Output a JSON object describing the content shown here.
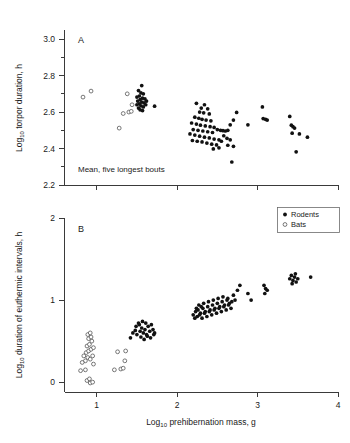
{
  "figure": {
    "background": "#ffffff",
    "point_color_rodents": "#111111",
    "point_color_bats": "#ffffff",
    "point_stroke_bats": "#555555",
    "axis_color": "#3a3a3a"
  },
  "legend": {
    "position": "top-right-of-panel-B",
    "entries": [
      {
        "label": "Rodents",
        "marker": "filled-circle"
      },
      {
        "label": "Bats",
        "marker": "open-circle"
      }
    ]
  },
  "panelA": {
    "letter": "A",
    "annotation": "Mean, five longest bouts",
    "ylabel_main": "Log",
    "ylabel_sub": "10",
    "ylabel_rest": " torpor duration, h",
    "yticklabels": [
      "3.0",
      "2.8",
      "2.6",
      "2.4",
      "2.2"
    ]
  },
  "panelB": {
    "letter": "B",
    "ylabel_main": "Log",
    "ylabel_sub": "10",
    "ylabel_rest": " duration of euthermic intervals, h",
    "yticklabels": [
      "2",
      "1",
      "0"
    ]
  },
  "xaxis": {
    "label_main": "Log",
    "label_sub": "10",
    "label_rest": " prehibernation mass, g",
    "ticklabels": [
      "1",
      "2",
      "3",
      "4"
    ]
  },
  "chart_data": [
    {
      "type": "scatter",
      "panel": "A",
      "title": "A",
      "annotation": "Mean, five longest bouts",
      "xlabel": "Log10 prehibernation mass, g",
      "ylabel": "Log10 torpor duration, h",
      "xlim": [
        0.6,
        4.0
      ],
      "ylim": [
        2.2,
        3.05
      ],
      "yticks": [
        2.2,
        2.4,
        2.6,
        2.8,
        3.0
      ],
      "yminorticks": [
        2.3,
        2.5,
        2.7,
        2.9
      ],
      "xticks": [
        1,
        2,
        3,
        4
      ],
      "xticklabels_shown": false,
      "grid": false,
      "series": [
        {
          "name": "Bats",
          "marker": "open-circle",
          "points": [
            [
              0.83,
              2.682
            ],
            [
              0.93,
              2.715
            ],
            [
              1.28,
              2.512
            ],
            [
              1.33,
              2.592
            ],
            [
              1.38,
              2.7
            ],
            [
              1.4,
              2.6
            ],
            [
              1.44,
              2.64
            ],
            [
              1.43,
              2.604
            ]
          ]
        },
        {
          "name": "Rodents",
          "marker": "filled-circle",
          "points": [
            [
              1.56,
              2.745
            ],
            [
              1.52,
              2.718
            ],
            [
              1.55,
              2.705
            ],
            [
              1.58,
              2.7
            ],
            [
              1.53,
              2.688
            ],
            [
              1.5,
              2.682
            ],
            [
              1.57,
              2.676
            ],
            [
              1.6,
              2.672
            ],
            [
              1.54,
              2.668
            ],
            [
              1.51,
              2.66
            ],
            [
              1.56,
              2.655
            ],
            [
              1.59,
              2.65
            ],
            [
              1.53,
              2.645
            ],
            [
              1.5,
              2.64
            ],
            [
              1.55,
              2.634
            ],
            [
              1.58,
              2.628
            ],
            [
              1.52,
              2.622
            ],
            [
              1.62,
              2.66
            ],
            [
              1.61,
              2.64
            ],
            [
              1.54,
              2.612
            ],
            [
              1.57,
              2.608
            ],
            [
              1.72,
              2.632
            ],
            [
              2.24,
              2.648
            ],
            [
              2.3,
              2.622
            ],
            [
              2.34,
              2.64
            ],
            [
              2.38,
              2.618
            ],
            [
              2.28,
              2.6
            ],
            [
              2.33,
              2.596
            ],
            [
              2.4,
              2.59
            ],
            [
              2.22,
              2.572
            ],
            [
              2.27,
              2.566
            ],
            [
              2.31,
              2.56
            ],
            [
              2.36,
              2.556
            ],
            [
              2.42,
              2.552
            ],
            [
              2.18,
              2.54
            ],
            [
              2.24,
              2.534
            ],
            [
              2.29,
              2.528
            ],
            [
              2.35,
              2.524
            ],
            [
              2.41,
              2.52
            ],
            [
              2.46,
              2.516
            ],
            [
              2.2,
              2.504
            ],
            [
              2.26,
              2.5
            ],
            [
              2.32,
              2.496
            ],
            [
              2.38,
              2.492
            ],
            [
              2.44,
              2.488
            ],
            [
              2.5,
              2.504
            ],
            [
              2.54,
              2.5
            ],
            [
              2.57,
              2.498
            ],
            [
              2.6,
              2.496
            ],
            [
              2.63,
              2.5
            ],
            [
              2.16,
              2.48
            ],
            [
              2.22,
              2.474
            ],
            [
              2.28,
              2.468
            ],
            [
              2.34,
              2.462
            ],
            [
              2.4,
              2.458
            ],
            [
              2.46,
              2.452
            ],
            [
              2.52,
              2.448
            ],
            [
              2.19,
              2.444
            ],
            [
              2.25,
              2.44
            ],
            [
              2.31,
              2.436
            ],
            [
              2.37,
              2.43
            ],
            [
              2.43,
              2.424
            ],
            [
              2.49,
              2.42
            ],
            [
              2.55,
              2.44
            ],
            [
              2.58,
              2.47
            ],
            [
              2.62,
              2.456
            ],
            [
              2.66,
              2.53
            ],
            [
              2.7,
              2.556
            ],
            [
              2.74,
              2.598
            ],
            [
              2.66,
              2.448
            ],
            [
              2.7,
              2.412
            ],
            [
              2.63,
              2.418
            ],
            [
              2.68,
              2.326
            ],
            [
              2.52,
              2.404
            ],
            [
              2.45,
              2.398
            ],
            [
              2.88,
              2.53
            ],
            [
              3.06,
              2.628
            ],
            [
              3.07,
              2.564
            ],
            [
              3.1,
              2.56
            ],
            [
              3.12,
              2.556
            ],
            [
              3.4,
              2.576
            ],
            [
              3.42,
              2.528
            ],
            [
              3.44,
              2.52
            ],
            [
              3.46,
              2.512
            ],
            [
              3.43,
              2.484
            ],
            [
              3.52,
              2.48
            ],
            [
              3.48,
              2.382
            ],
            [
              3.62,
              2.462
            ]
          ]
        }
      ]
    },
    {
      "type": "scatter",
      "panel": "B",
      "title": "B",
      "xlabel": "Log10 prehibernation mass, g",
      "ylabel": "Log10 duration of euthermic intervals, h",
      "xlim": [
        0.6,
        4.0
      ],
      "ylim": [
        -0.12,
        2.0
      ],
      "yticks": [
        0,
        1,
        2
      ],
      "xticks": [
        1,
        2,
        3,
        4
      ],
      "xticklabels_shown": true,
      "grid": false,
      "series": [
        {
          "name": "Bats",
          "marker": "open-circle",
          "points": [
            [
              0.8,
              0.14
            ],
            [
              0.86,
              0.15
            ],
            [
              0.88,
              0.02
            ],
            [
              0.91,
              0.04
            ],
            [
              0.92,
              -0.01
            ],
            [
              0.95,
              0.0
            ],
            [
              0.86,
              0.26
            ],
            [
              0.89,
              0.3
            ],
            [
              0.92,
              0.28
            ],
            [
              0.95,
              0.32
            ],
            [
              0.87,
              0.36
            ],
            [
              0.9,
              0.38
            ],
            [
              0.93,
              0.4
            ],
            [
              0.96,
              0.42
            ],
            [
              0.88,
              0.44
            ],
            [
              0.91,
              0.46
            ],
            [
              0.94,
              0.5
            ],
            [
              0.9,
              0.53
            ],
            [
              0.93,
              0.55
            ],
            [
              0.89,
              0.58
            ],
            [
              0.92,
              0.6
            ],
            [
              0.82,
              0.24
            ],
            [
              0.84,
              0.32
            ],
            [
              0.96,
              0.22
            ],
            [
              1.22,
              0.15
            ],
            [
              1.3,
              0.16
            ],
            [
              1.26,
              0.37
            ],
            [
              1.36,
              0.38
            ],
            [
              1.35,
              0.26
            ],
            [
              1.33,
              0.17
            ]
          ]
        },
        {
          "name": "Rodents",
          "marker": "filled-circle",
          "points": [
            [
              1.42,
              0.54
            ],
            [
              1.45,
              0.6
            ],
            [
              1.48,
              0.63
            ],
            [
              1.5,
              0.58
            ],
            [
              1.52,
              0.72
            ],
            [
              1.54,
              0.62
            ],
            [
              1.56,
              0.66
            ],
            [
              1.58,
              0.6
            ],
            [
              1.6,
              0.64
            ],
            [
              1.62,
              0.58
            ],
            [
              1.64,
              0.68
            ],
            [
              1.66,
              0.62
            ],
            [
              1.68,
              0.7
            ],
            [
              1.7,
              0.64
            ],
            [
              1.72,
              0.6
            ],
            [
              1.55,
              0.55
            ],
            [
              1.59,
              0.52
            ],
            [
              1.63,
              0.56
            ],
            [
              1.67,
              0.54
            ],
            [
              1.71,
              0.58
            ],
            [
              1.49,
              0.68
            ],
            [
              1.53,
              0.7
            ],
            [
              1.57,
              0.74
            ],
            [
              1.61,
              0.72
            ],
            [
              2.2,
              0.82
            ],
            [
              2.23,
              0.86
            ],
            [
              2.26,
              0.88
            ],
            [
              2.29,
              0.84
            ],
            [
              2.32,
              0.9
            ],
            [
              2.35,
              0.86
            ],
            [
              2.38,
              0.92
            ],
            [
              2.41,
              0.88
            ],
            [
              2.44,
              0.94
            ],
            [
              2.47,
              0.9
            ],
            [
              2.5,
              0.96
            ],
            [
              2.53,
              0.92
            ],
            [
              2.56,
              0.98
            ],
            [
              2.59,
              0.94
            ],
            [
              2.62,
              1.0
            ],
            [
              2.65,
              0.96
            ],
            [
              2.22,
              0.78
            ],
            [
              2.25,
              0.8
            ],
            [
              2.28,
              0.82
            ],
            [
              2.31,
              0.78
            ],
            [
              2.34,
              0.84
            ],
            [
              2.37,
              0.8
            ],
            [
              2.4,
              0.86
            ],
            [
              2.43,
              0.82
            ],
            [
              2.46,
              0.88
            ],
            [
              2.49,
              0.84
            ],
            [
              2.52,
              0.9
            ],
            [
              2.55,
              0.86
            ],
            [
              2.58,
              0.92
            ],
            [
              2.61,
              0.88
            ],
            [
              2.64,
              0.94
            ],
            [
              2.67,
              0.9
            ],
            [
              2.27,
              0.94
            ],
            [
              2.33,
              0.96
            ],
            [
              2.39,
              0.98
            ],
            [
              2.45,
              1.0
            ],
            [
              2.51,
              1.02
            ],
            [
              2.57,
              1.04
            ],
            [
              2.63,
              1.02
            ],
            [
              2.68,
              0.98
            ],
            [
              2.7,
              1.06
            ],
            [
              2.72,
              1.0
            ],
            [
              2.75,
              1.12
            ],
            [
              2.78,
              1.18
            ],
            [
              2.88,
              1.08
            ],
            [
              2.92,
              1.0
            ],
            [
              2.24,
              0.9
            ],
            [
              2.3,
              0.92
            ],
            [
              3.08,
              1.18
            ],
            [
              3.1,
              1.14
            ],
            [
              3.12,
              1.12
            ],
            [
              3.09,
              1.08
            ],
            [
              3.4,
              1.26
            ],
            [
              3.42,
              1.3
            ],
            [
              3.44,
              1.24
            ],
            [
              3.46,
              1.28
            ],
            [
              3.48,
              1.22
            ],
            [
              3.43,
              1.2
            ],
            [
              3.47,
              1.32
            ],
            [
              3.5,
              1.26
            ],
            [
              3.66,
              1.28
            ]
          ]
        }
      ]
    }
  ]
}
